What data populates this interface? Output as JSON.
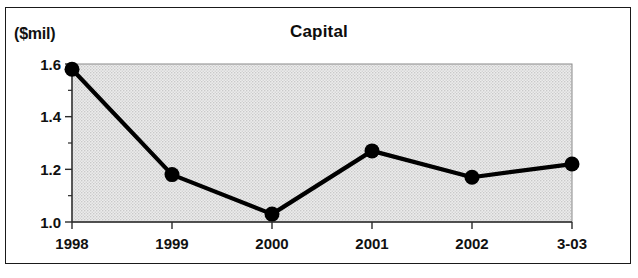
{
  "figure": {
    "unit_label": "($mil)",
    "title": "Capital"
  },
  "chart_data": {
    "type": "line",
    "title": "Capital",
    "subtitle": "",
    "xlabel": "",
    "ylabel": "($mil)",
    "unit": "$mil",
    "categories": [
      "1998",
      "1999",
      "2000",
      "2001",
      "2002",
      "3-03"
    ],
    "values": [
      1.58,
      1.18,
      1.03,
      1.27,
      1.17,
      1.22
    ],
    "series": [
      {
        "name": "Capital",
        "values": [
          1.58,
          1.18,
          1.03,
          1.27,
          1.17,
          1.22
        ]
      }
    ],
    "ylim": [
      1.0,
      1.6
    ],
    "yticks": [
      "1.0",
      "1.2",
      "1.4",
      "1.6"
    ],
    "ytick_values": [
      1.0,
      1.2,
      1.4,
      1.6
    ],
    "yminor_values": [
      1.1,
      1.3,
      1.5
    ],
    "xticks": [
      "1998",
      "1999",
      "2000",
      "2001",
      "2002",
      "3-03"
    ],
    "grid": false,
    "legend": false,
    "legend_position": "none",
    "marker": "circle",
    "line_color": "#000000",
    "marker_color": "#000000",
    "plot_background": "#e4e4e4",
    "frame_color": "#1a1a1a"
  },
  "yaxis": {
    "labels": [
      "1.6",
      "1.4",
      "1.2",
      "1.0"
    ]
  },
  "xaxis": {
    "labels": [
      "1998",
      "1999",
      "2000",
      "2001",
      "2002",
      "3-03"
    ]
  }
}
